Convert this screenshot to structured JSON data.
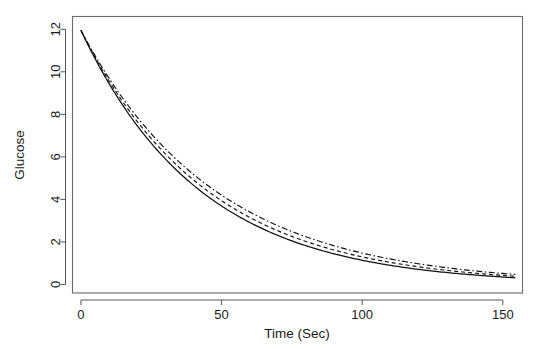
{
  "figure": {
    "background_color": "#ffffff",
    "frame_color": "#6b6b6b",
    "ink_color": "#111111"
  },
  "chart_data": {
    "type": "line",
    "title": "",
    "subtitle": "",
    "xlabel": "Time (Sec)",
    "ylabel": "Glucose",
    "xlim": [
      -3,
      157
    ],
    "ylim": [
      -0.4,
      12.6
    ],
    "xticks": [
      0,
      50,
      100,
      150
    ],
    "xtick_labels": [
      "0",
      "50",
      "100",
      "150"
    ],
    "yticks": [
      0,
      2,
      4,
      6,
      8,
      10,
      12
    ],
    "ytick_labels": [
      "0",
      "2",
      "4",
      "6",
      "8",
      "10",
      "12"
    ],
    "grid": false,
    "legend": null,
    "legend_position": "none",
    "annotations": [],
    "x": [
      0,
      5,
      10,
      15,
      20,
      25,
      30,
      35,
      40,
      45,
      50,
      55,
      60,
      65,
      70,
      75,
      80,
      85,
      90,
      95,
      100,
      105,
      110,
      115,
      120,
      125,
      130,
      135,
      140,
      145,
      150,
      155
    ],
    "series": [
      {
        "name": "solid",
        "line_style": "solid",
        "dash_pattern": "none",
        "color": "#111111",
        "line_width": 1.25,
        "decay_rate": 0.0235,
        "initial_value": 11.95,
        "values": [
          11.95,
          10.63,
          9.45,
          8.4,
          7.47,
          6.64,
          5.9,
          5.25,
          4.67,
          4.15,
          3.69,
          3.28,
          2.92,
          2.59,
          2.31,
          2.05,
          1.82,
          1.62,
          1.44,
          1.28,
          1.14,
          1.01,
          0.9,
          0.8,
          0.71,
          0.63,
          0.56,
          0.5,
          0.44,
          0.39,
          0.35,
          0.31
        ]
      },
      {
        "name": "dashed",
        "line_style": "dashed",
        "dash_pattern": "4 3",
        "color": "#111111",
        "line_width": 1.15,
        "decay_rate": 0.0222,
        "initial_value": 11.95,
        "values": [
          11.95,
          10.7,
          9.57,
          8.57,
          7.67,
          6.86,
          6.14,
          5.5,
          4.92,
          4.4,
          3.94,
          3.53,
          3.16,
          2.83,
          2.53,
          2.26,
          2.03,
          1.81,
          1.62,
          1.45,
          1.3,
          1.16,
          1.04,
          0.93,
          0.83,
          0.75,
          0.67,
          0.6,
          0.53,
          0.48,
          0.43,
          0.38
        ]
      },
      {
        "name": "dash-dot",
        "line_style": "dashdot",
        "dash_pattern": "6 2.5 1.5 2.5",
        "color": "#111111",
        "line_width": 1.15,
        "decay_rate": 0.0209,
        "initial_value": 11.95,
        "values": [
          11.95,
          10.77,
          9.7,
          8.74,
          7.87,
          7.09,
          6.39,
          5.76,
          5.19,
          4.67,
          4.21,
          3.79,
          3.42,
          3.08,
          2.77,
          2.5,
          2.25,
          2.03,
          1.83,
          1.65,
          1.48,
          1.34,
          1.2,
          1.08,
          0.98,
          0.88,
          0.79,
          0.71,
          0.64,
          0.58,
          0.52,
          0.47
        ]
      }
    ]
  }
}
